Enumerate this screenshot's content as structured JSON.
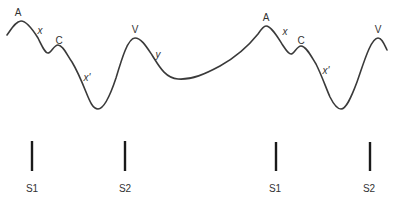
{
  "diagram": {
    "wave_labels": [
      {
        "id": "a1",
        "text": "A",
        "x": 20,
        "y": 16,
        "italic": false
      },
      {
        "id": "x1",
        "text": "x",
        "x": 40,
        "y": 35,
        "italic": true
      },
      {
        "id": "c1",
        "text": "C",
        "x": 59,
        "y": 44,
        "italic": false
      },
      {
        "id": "xp1",
        "text": "x'",
        "x": 86,
        "y": 81,
        "italic": true
      },
      {
        "id": "v1",
        "text": "V",
        "x": 135,
        "y": 33,
        "italic": false
      },
      {
        "id": "y1",
        "text": "y",
        "x": 158,
        "y": 58,
        "italic": true
      },
      {
        "id": "a2",
        "text": "A",
        "x": 266,
        "y": 21,
        "italic": false
      },
      {
        "id": "x2",
        "text": "x",
        "x": 285,
        "y": 35,
        "italic": true
      },
      {
        "id": "c2",
        "text": "C",
        "x": 301,
        "y": 44,
        "italic": false
      },
      {
        "id": "xp2",
        "text": "x'",
        "x": 325,
        "y": 74,
        "italic": true
      },
      {
        "id": "v2",
        "text": "V",
        "x": 378,
        "y": 33,
        "italic": false
      }
    ],
    "heart_sounds": [
      {
        "label": "S1",
        "x": 32
      },
      {
        "label": "S2",
        "x": 125
      },
      {
        "label": "S1",
        "x": 276
      },
      {
        "label": "S2",
        "x": 370
      }
    ],
    "colors": {
      "curve": "#3a3a3a",
      "marker": "#1a1a1a",
      "text": "#333333"
    }
  }
}
